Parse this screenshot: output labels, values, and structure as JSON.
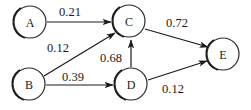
{
  "diagram": {
    "type": "directed-weighted-graph",
    "background_color": "#ffffff",
    "stroke_color": "#1a1a1a",
    "nodes": [
      {
        "id": "A",
        "label": "A",
        "cx": 30,
        "cy": 22,
        "r": 16
      },
      {
        "id": "B",
        "label": "B",
        "cx": 29,
        "cy": 84,
        "r": 16
      },
      {
        "id": "C",
        "label": "C",
        "cx": 129,
        "cy": 21,
        "r": 16
      },
      {
        "id": "D",
        "label": "D",
        "cx": 131,
        "cy": 84,
        "r": 16
      },
      {
        "id": "E",
        "label": "E",
        "cx": 223,
        "cy": 54,
        "r": 16
      }
    ],
    "edges": [
      {
        "from": "A",
        "to": "C",
        "weight": "0.21",
        "x1": 47,
        "y1": 22,
        "x2": 111,
        "y2": 22,
        "lx": 70,
        "ly": 12
      },
      {
        "from": "B",
        "to": "C",
        "weight": "0.12",
        "x1": 44,
        "y1": 76,
        "x2": 115,
        "y2": 33,
        "lx": 58,
        "ly": 48
      },
      {
        "from": "B",
        "to": "D",
        "weight": "0.39",
        "x1": 46,
        "y1": 85,
        "x2": 113,
        "y2": 85,
        "lx": 73,
        "ly": 77
      },
      {
        "from": "D",
        "to": "C",
        "weight": "0.68",
        "x1": 131,
        "y1": 67,
        "x2": 131,
        "y2": 40,
        "lx": 111,
        "ly": 58
      },
      {
        "from": "C",
        "to": "E",
        "weight": "0.72",
        "x1": 145,
        "y1": 29,
        "x2": 208,
        "y2": 47,
        "lx": 177,
        "ly": 23
      },
      {
        "from": "D",
        "to": "E",
        "weight": "0.12",
        "x1": 148,
        "y1": 80,
        "x2": 207,
        "y2": 61,
        "lx": 173,
        "ly": 89
      }
    ]
  }
}
